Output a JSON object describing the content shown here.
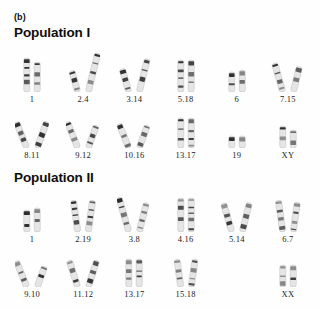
{
  "figure": {
    "panel_tag": "(b)",
    "background_color": "#ffffff",
    "ink_color": "#2b2b2b"
  },
  "populations": [
    {
      "id": "population-1",
      "header": "Population I",
      "rows": [
        {
          "id": "p1r1",
          "cells": [
            {
              "label": "1",
              "style": "straight-pair",
              "heights": [
                34,
                30
              ]
            },
            {
              "label": "2.4",
              "style": "bent-pair",
              "heights": [
                22,
                40
              ]
            },
            {
              "label": "3.14",
              "style": "bent-pair",
              "heights": [
                24,
                34
              ]
            },
            {
              "label": "5.18",
              "style": "straight-pair",
              "heights": [
                32,
                32
              ]
            },
            {
              "label": "6",
              "style": "short-pair",
              "heights": [
                20,
                22
              ]
            },
            {
              "label": "7.15",
              "style": "bent-pair",
              "heights": [
                30,
                26
              ]
            }
          ]
        },
        {
          "id": "p1r2",
          "cells": [
            {
              "label": "8.11",
              "style": "hook-pair",
              "heights": [
                28,
                28
              ]
            },
            {
              "label": "9.12",
              "style": "hook-pair",
              "heights": [
                28,
                24
              ]
            },
            {
              "label": "10.16",
              "style": "hook-pair",
              "heights": [
                26,
                24
              ]
            },
            {
              "label": "13.17",
              "style": "straight-pair",
              "heights": [
                30,
                30
              ]
            },
            {
              "label": "19",
              "style": "tiny-pair",
              "heights": [
                12,
                12
              ]
            },
            {
              "label": "XY",
              "style": "xy-pair",
              "heights": [
                22,
                18
              ]
            }
          ]
        }
      ]
    },
    {
      "id": "population-2",
      "header": "Population II",
      "rows": [
        {
          "id": "p2r1",
          "cells": [
            {
              "label": "1",
              "style": "short-pair",
              "heights": [
                22,
                24
              ]
            },
            {
              "label": "2.19",
              "style": "curved-pair",
              "heights": [
                32,
                32
              ]
            },
            {
              "label": "3.8",
              "style": "bent-pair",
              "heights": [
                36,
                30
              ]
            },
            {
              "label": "4.16",
              "style": "straight-pair",
              "heights": [
                34,
                34
              ]
            },
            {
              "label": "5.14",
              "style": "bent-pair",
              "heights": [
                30,
                30
              ]
            },
            {
              "label": "6.7",
              "style": "curved-pair",
              "heights": [
                32,
                30
              ]
            }
          ]
        },
        {
          "id": "p2r2",
          "cells": [
            {
              "label": "9.10",
              "style": "hook-pair",
              "heights": [
                28,
                22
              ]
            },
            {
              "label": "11.12",
              "style": "x-pair",
              "heights": [
                28,
                28
              ]
            },
            {
              "label": "13.17",
              "style": "straight-pair",
              "heights": [
                28,
                28
              ]
            },
            {
              "label": "15.18",
              "style": "curved-pair",
              "heights": [
                28,
                28
              ]
            },
            {
              "label": "",
              "style": "empty",
              "heights": [
                0,
                0
              ]
            },
            {
              "label": "XX",
              "style": "short-pair",
              "heights": [
                22,
                22
              ]
            }
          ]
        }
      ]
    }
  ]
}
